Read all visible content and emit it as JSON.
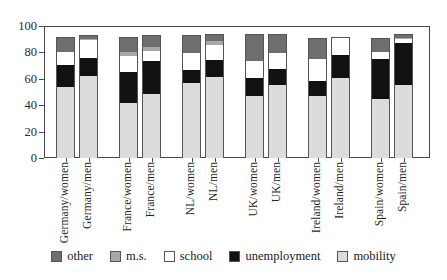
{
  "chart_data": {
    "type": "bar",
    "subtype": "stacked-vertical",
    "title": "",
    "xlabel": "",
    "ylabel": "",
    "ylim": [
      0,
      100
    ],
    "yticks": [
      0,
      20,
      40,
      60,
      80,
      100
    ],
    "ytick_labels": [
      "0",
      "20",
      "40",
      "60",
      "80",
      "100"
    ],
    "grid": false,
    "legend_position": "bottom",
    "categories": [
      "Germany/women",
      "Germany/men",
      "France/women",
      "France/men",
      "NL/women",
      "NL/men",
      "UK/women",
      "UK/men",
      "Ireland/women",
      "Ireland/men",
      "Spain/women",
      "Spain/men"
    ],
    "group_pairs": [
      [
        "Germany/women",
        "Germany/men"
      ],
      [
        "France/women",
        "France/men"
      ],
      [
        "NL/women",
        "NL/men"
      ],
      [
        "UK/women",
        "UK/men"
      ],
      [
        "Ireland/women",
        "Ireland/men"
      ],
      [
        "Spain/women",
        "Spain/men"
      ]
    ],
    "series": [
      {
        "name": "mobility",
        "color": "#dcdcdc",
        "values": [
          54,
          63,
          42,
          49,
          57,
          62,
          47,
          56,
          47,
          61,
          45,
          56
        ]
      },
      {
        "name": "unemployment",
        "color": "#111111",
        "values": [
          17,
          13,
          24,
          25,
          10,
          13,
          14,
          12,
          12,
          18,
          31,
          32
        ]
      },
      {
        "name": "school",
        "color": "#ffffff",
        "values": [
          10,
          14,
          12,
          8,
          13,
          11,
          13,
          12,
          17,
          13,
          5,
          3
        ]
      },
      {
        "name": "m.s.",
        "color": "#a8a8a8",
        "values": [
          0,
          1,
          3,
          3,
          0,
          3,
          0,
          0,
          0,
          0,
          0,
          1
        ]
      },
      {
        "name": "other",
        "color": "#6e6e6e",
        "values": [
          11,
          2,
          11,
          8,
          13,
          5,
          20,
          14,
          15,
          0,
          10,
          2
        ]
      }
    ],
    "totals": [
      92,
      93,
      92,
      93,
      93,
      94,
      94,
      94,
      91,
      92,
      91,
      94
    ],
    "legend": [
      {
        "label": "other",
        "key": "other",
        "color": "#6e6e6e"
      },
      {
        "label": "m.s.",
        "key": "ms",
        "color": "#a8a8a8"
      },
      {
        "label": "school",
        "key": "school",
        "color": "#ffffff"
      },
      {
        "label": "unemployment",
        "key": "unemployment",
        "color": "#111111"
      },
      {
        "label": "mobility",
        "key": "mobility",
        "color": "#dcdcdc"
      }
    ]
  },
  "axis": {
    "frame_color": "#4a4a4a",
    "tick_color": "#4a4a4a"
  }
}
